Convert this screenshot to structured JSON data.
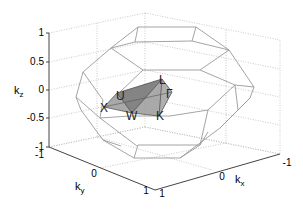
{
  "figure": {
    "type": "3d-wireframe",
    "axes": {
      "x": {
        "label": "k",
        "subscript": "x",
        "ticks": [
          "1",
          "0",
          "-1"
        ]
      },
      "y": {
        "label": "k",
        "subscript": "y",
        "ticks": [
          "-1",
          "0",
          "1"
        ]
      },
      "z": {
        "label": "k",
        "subscript": "z",
        "ticks": [
          "1",
          "0.5",
          "0",
          "-0.5",
          "-1"
        ]
      }
    },
    "points": [
      {
        "name": "L"
      },
      {
        "name": "U"
      },
      {
        "name": "Γ"
      },
      {
        "name": "X"
      },
      {
        "name": "W"
      },
      {
        "name": "K"
      }
    ],
    "colors": {
      "wireframe": "#9a9a9a",
      "wedge_fill": "#8a8a8a",
      "grid": "#bbbbbb",
      "axis": "#444444"
    }
  }
}
